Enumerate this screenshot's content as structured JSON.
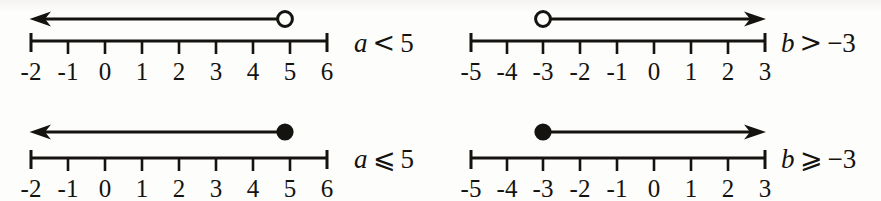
{
  "figure": {
    "type": "number-line-inequality-graphs",
    "background_color": "#fdfdfc",
    "ink_color": "#15130f",
    "panel_count": 4
  },
  "panels": [
    {
      "id": "a-less-than-5",
      "position": "top-left",
      "axis": {
        "ticks": [
          "-2",
          "-1",
          "0",
          "1",
          "2",
          "3",
          "4",
          "5",
          "6"
        ],
        "min": -2,
        "max": 6
      },
      "graph": {
        "endpoint_value": 5,
        "endpoint_style": "open-circle",
        "ray_direction": "left",
        "arrowhead": "left"
      },
      "label": {
        "variable": "a",
        "relation": "<",
        "value": "5",
        "full": "a < 5"
      }
    },
    {
      "id": "b-greater-than-neg3",
      "position": "top-right",
      "axis": {
        "ticks": [
          "-5",
          "-4",
          "-3",
          "-2",
          "-1",
          "0",
          "1",
          "2",
          "3"
        ],
        "min": -5,
        "max": 3
      },
      "graph": {
        "endpoint_value": -3,
        "endpoint_style": "open-circle",
        "ray_direction": "right",
        "arrowhead": "right"
      },
      "label": {
        "variable": "b",
        "relation": ">",
        "value": "−3",
        "full": "b > −3"
      }
    },
    {
      "id": "a-less-equal-5",
      "position": "bottom-left",
      "axis": {
        "ticks": [
          "-2",
          "-1",
          "0",
          "1",
          "2",
          "3",
          "4",
          "5",
          "6"
        ],
        "min": -2,
        "max": 6
      },
      "graph": {
        "endpoint_value": 5,
        "endpoint_style": "closed-circle",
        "ray_direction": "left",
        "arrowhead": "left"
      },
      "label": {
        "variable": "a",
        "relation": "⩽",
        "value": "5",
        "full": "a ⩽ 5"
      }
    },
    {
      "id": "b-greater-equal-neg3",
      "position": "bottom-right",
      "axis": {
        "ticks": [
          "-5",
          "-4",
          "-3",
          "-2",
          "-1",
          "0",
          "1",
          "2",
          "3"
        ],
        "min": -5,
        "max": 3
      },
      "graph": {
        "endpoint_value": -3,
        "endpoint_style": "closed-circle",
        "ray_direction": "right",
        "arrowhead": "right"
      },
      "label": {
        "variable": "b",
        "relation": "⩾",
        "value": "−3",
        "full": "b ⩾ −3"
      }
    }
  ]
}
